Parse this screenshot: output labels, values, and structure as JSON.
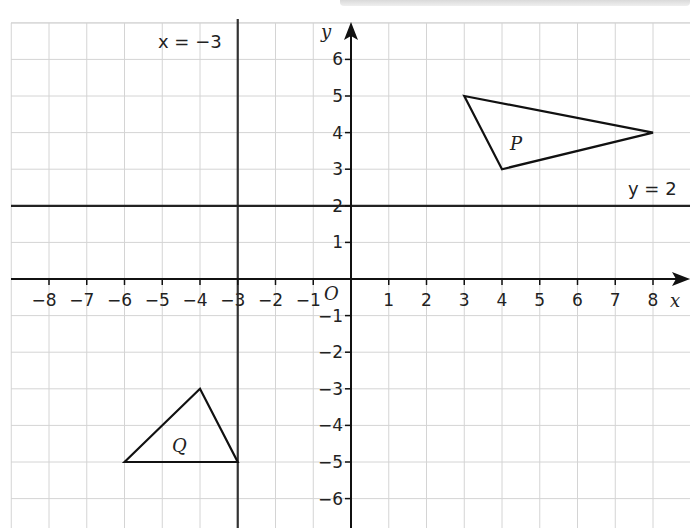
{
  "chart_data": {
    "type": "scatter",
    "title": "",
    "xlabel": "x",
    "ylabel": "y",
    "origin_label": "O",
    "xlim": [
      -9,
      9
    ],
    "ylim": [
      -6.5,
      6.8
    ],
    "grid": true,
    "x_ticks": [
      -8,
      -7,
      -6,
      -5,
      -4,
      -3,
      -2,
      -1,
      1,
      2,
      3,
      4,
      5,
      6,
      7,
      8
    ],
    "y_ticks": [
      -6,
      -5,
      -4,
      -3,
      -2,
      -1,
      1,
      2,
      3,
      4,
      5,
      6
    ],
    "x_tick_labels": [
      "−8",
      "−7",
      "−6",
      "−5",
      "−4",
      "−3",
      "−2",
      "−1",
      "1",
      "2",
      "3",
      "4",
      "5",
      "6",
      "7",
      "8"
    ],
    "y_tick_labels": [
      "−6",
      "−5",
      "−4",
      "−3",
      "−2",
      "−1",
      "1",
      "2",
      "3",
      "4",
      "5",
      "6"
    ],
    "lines": [
      {
        "label": "x = −3",
        "type": "vertical",
        "x": -3
      },
      {
        "label": "y = 2",
        "type": "horizontal",
        "y": 2
      }
    ],
    "shapes": [
      {
        "name": "P",
        "type": "triangle",
        "vertices": [
          [
            3,
            5
          ],
          [
            8,
            4
          ],
          [
            4,
            3
          ]
        ]
      },
      {
        "name": "Q",
        "type": "triangle",
        "vertices": [
          [
            -6,
            -5
          ],
          [
            -4,
            -3
          ],
          [
            -3,
            -5
          ]
        ]
      }
    ]
  },
  "labels": {
    "x_axis": "x",
    "y_axis": "y",
    "origin": "O",
    "line_x": "x = −3",
    "line_y": "y = 2",
    "shape_p": "P",
    "shape_q": "Q"
  }
}
